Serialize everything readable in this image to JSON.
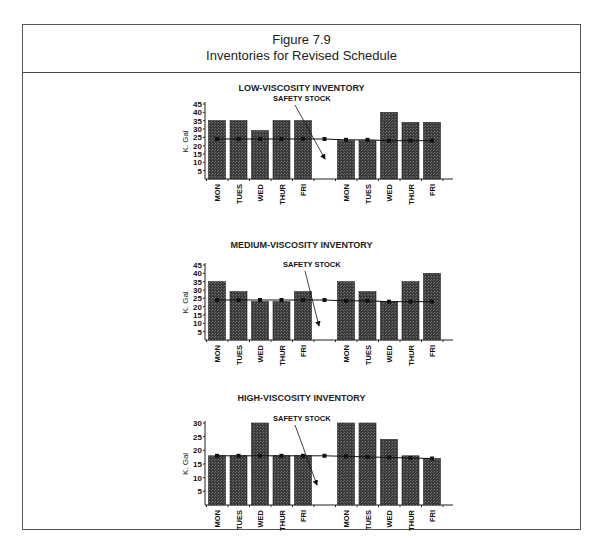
{
  "figure": {
    "number": "Figure 7.9",
    "title": "Inventories for Revised Schedule"
  },
  "chart_data": [
    {
      "type": "bar",
      "title": "LOW-VISCOSITY INVENTORY",
      "ylabel": "K. Gal",
      "ylim": [
        0,
        45
      ],
      "yticks": [
        5,
        10,
        15,
        20,
        25,
        30,
        35,
        40,
        45
      ],
      "categories": [
        "MON",
        "TUES",
        "WED",
        "THUR",
        "FRI",
        "MON",
        "TUES",
        "WED",
        "THUR",
        "FRI"
      ],
      "values": [
        35,
        35,
        29,
        35,
        35,
        23,
        23,
        40,
        34,
        34
      ],
      "safety_stock": {
        "label": "SAFETY STOCK",
        "values": [
          24,
          24,
          24,
          24,
          24,
          24,
          23.5,
          23.5,
          23,
          23,
          23
        ],
        "gap_marker_value": 24
      },
      "annotation": "SAFETY STOCK"
    },
    {
      "type": "bar",
      "title": "MEDIUM-VISCOSITY INVENTORY",
      "ylabel": "K. Gal",
      "ylim": [
        0,
        45
      ],
      "yticks": [
        5,
        10,
        15,
        20,
        25,
        30,
        35,
        40,
        45
      ],
      "categories": [
        "MON",
        "TUES",
        "WED",
        "THUR",
        "FRI",
        "MON",
        "TUES",
        "WED",
        "THUR",
        "FRI"
      ],
      "values": [
        35,
        29,
        23,
        23,
        29,
        35,
        29,
        23,
        35,
        40
      ],
      "safety_stock": {
        "label": "SAFETY STOCK",
        "values": [
          24,
          24,
          24,
          24,
          24,
          24,
          23.5,
          23.5,
          23,
          23,
          23
        ],
        "gap_marker_value": 24
      },
      "annotation": "SAFETY STOCK"
    },
    {
      "type": "bar",
      "title": "HIGH-VISCOSITY INVENTORY",
      "ylabel": "K. Gal",
      "ylim": [
        0,
        30
      ],
      "yticks": [
        5,
        10,
        15,
        20,
        25,
        30
      ],
      "categories": [
        "MON",
        "TUES",
        "WED",
        "THUR",
        "FRI",
        "MON",
        "TUES",
        "WED",
        "THUR",
        "FRI"
      ],
      "values": [
        18,
        18,
        30,
        18,
        18,
        30,
        30,
        24,
        18,
        17
      ],
      "safety_stock": {
        "label": "SAFETY STOCK",
        "values": [
          18,
          18,
          18,
          18,
          18,
          18,
          17.8,
          17.6,
          17.4,
          17.2,
          17
        ],
        "gap_marker_value": 18
      },
      "annotation": "SAFETY STOCK"
    }
  ]
}
